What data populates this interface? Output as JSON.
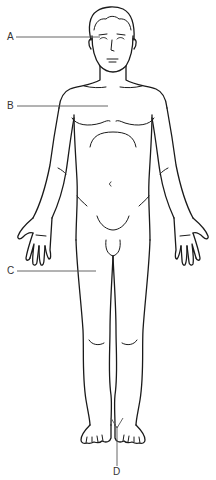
{
  "diagram": {
    "labels": [
      {
        "id": "A",
        "text": "A",
        "x": 7,
        "y": 32,
        "target": "eye / face region",
        "line": {
          "x1": 16,
          "y1": 37,
          "x2": 100,
          "y2": 37
        }
      },
      {
        "id": "B",
        "text": "B",
        "x": 7,
        "y": 101,
        "target": "chest / sternum region",
        "line": {
          "x1": 17,
          "y1": 106,
          "x2": 108,
          "y2": 106
        }
      },
      {
        "id": "C",
        "text": "C",
        "x": 7,
        "y": 266,
        "target": "thigh",
        "line": {
          "x1": 17,
          "y1": 271,
          "x2": 96,
          "y2": 271
        }
      },
      {
        "id": "D",
        "text": "D",
        "x": 113,
        "y": 469,
        "target": "between the feet / ankles",
        "line": {
          "x1": 117,
          "y1": 466,
          "x2": 117,
          "y2": 426
        }
      }
    ],
    "colors": {
      "background": "#ffffff",
      "outline": "#1a1a1a",
      "leader_line": "#555555",
      "label_text": "#333333"
    }
  }
}
